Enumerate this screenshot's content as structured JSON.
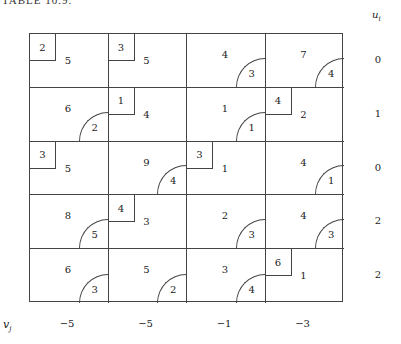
{
  "title": "TABLE 10.9.",
  "u_header": "u",
  "u_sub": "i",
  "v_header": "v",
  "v_sub": "j",
  "u_values": [
    "0",
    "1",
    "0",
    "2",
    "2"
  ],
  "v_values": [
    "−5",
    "−5",
    "−1",
    "−3"
  ],
  "rows": [
    {
      "cells": [
        {
          "basic": true,
          "cost": "2",
          "alloc": "5",
          "reduced": null
        },
        {
          "basic": true,
          "cost": "3",
          "alloc": "5",
          "reduced": null
        },
        {
          "basic": false,
          "cost": null,
          "alloc": "4",
          "reduced": "3"
        },
        {
          "basic": false,
          "cost": null,
          "alloc": "7",
          "reduced": "4"
        }
      ]
    },
    {
      "cells": [
        {
          "basic": false,
          "cost": null,
          "alloc": "6",
          "reduced": "2"
        },
        {
          "basic": true,
          "cost": "1",
          "alloc": "4",
          "reduced": null
        },
        {
          "basic": false,
          "cost": null,
          "alloc": "1",
          "reduced": "1"
        },
        {
          "basic": true,
          "cost": "4",
          "alloc": "2",
          "reduced": null
        }
      ]
    },
    {
      "cells": [
        {
          "basic": true,
          "cost": "3",
          "alloc": "5",
          "reduced": null
        },
        {
          "basic": false,
          "cost": null,
          "alloc": "9",
          "reduced": "4"
        },
        {
          "basic": true,
          "cost": "3",
          "alloc": "1",
          "reduced": null
        },
        {
          "basic": false,
          "cost": null,
          "alloc": "4",
          "reduced": "1"
        }
      ]
    },
    {
      "cells": [
        {
          "basic": false,
          "cost": null,
          "alloc": "8",
          "reduced": "5"
        },
        {
          "basic": true,
          "cost": "4",
          "alloc": "3",
          "reduced": null
        },
        {
          "basic": false,
          "cost": null,
          "alloc": "2",
          "reduced": "3"
        },
        {
          "basic": false,
          "cost": null,
          "alloc": "4",
          "reduced": "3"
        }
      ]
    },
    {
      "cells": [
        {
          "basic": false,
          "cost": null,
          "alloc": "6",
          "reduced": "3"
        },
        {
          "basic": false,
          "cost": null,
          "alloc": "5",
          "reduced": "2"
        },
        {
          "basic": false,
          "cost": null,
          "alloc": "3",
          "reduced": "4"
        },
        {
          "basic": true,
          "cost": "6",
          "alloc": "1",
          "reduced": null
        }
      ]
    }
  ]
}
